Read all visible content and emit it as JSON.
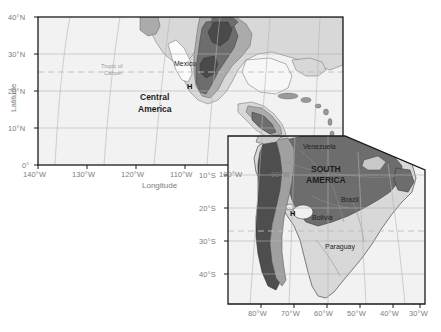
{
  "figure": {
    "background_color": "#ffffff",
    "type": "two-panel-locator-map"
  },
  "panels": [
    {
      "id": "north-panel",
      "name": "Central America panel",
      "frame": {
        "x": 38,
        "y": 17,
        "width": 305,
        "height": 148
      },
      "axes": {
        "x_title": "Longitude",
        "y_title": "Latitude",
        "x_ticks": [
          "140°W",
          "130°W",
          "120°W",
          "110°W",
          "100°W",
          "90°W"
        ],
        "x_values": [
          -140,
          -130,
          -120,
          -110,
          -100,
          -90
        ],
        "y_ticks": [
          "40°N",
          "30°N",
          "20°N",
          "10°N",
          "0°"
        ],
        "y_values": [
          40,
          30,
          20,
          10,
          0
        ],
        "xlim": [
          -145,
          -83
        ],
        "ylim": [
          0,
          40
        ]
      },
      "annotations": [
        {
          "text": "Tropic of Cancer",
          "kind": "graticule-label",
          "lat": 23.5
        },
        {
          "text": "Mexico",
          "kind": "country"
        },
        {
          "text": "Central America",
          "kind": "region"
        },
        {
          "text": "H",
          "kind": "point-marker"
        }
      ]
    },
    {
      "id": "south-panel",
      "name": "South America panel",
      "frame": {
        "x": 228,
        "y": 136,
        "width": 197,
        "height": 168
      },
      "axes": {
        "x_ticks": [
          "80°W",
          "70°W",
          "60°W",
          "50°W",
          "40°W",
          "30°W"
        ],
        "x_values": [
          -80,
          -70,
          -60,
          -50,
          -40,
          -30
        ],
        "y_ticks": [
          "10°S",
          "20°S",
          "30°S",
          "40°S"
        ],
        "y_values": [
          -10,
          -20,
          -30,
          -40
        ],
        "xlim": [
          -85,
          -27
        ],
        "ylim": [
          -42,
          12
        ]
      },
      "annotations": [
        {
          "text": "Venezuela",
          "kind": "country"
        },
        {
          "text": "SOUTH AMERICA",
          "kind": "region"
        },
        {
          "text": "Brazil",
          "kind": "country"
        },
        {
          "text": "Bolivia",
          "kind": "country"
        },
        {
          "text": "Paraguay",
          "kind": "country"
        },
        {
          "text": "H",
          "kind": "point-marker"
        },
        {
          "text": "Tropic of Capricorn",
          "kind": "graticule-line",
          "lat": -23.5,
          "labelled": false
        }
      ]
    }
  ],
  "labels": {
    "latitude_title": "Latitude",
    "longitude_title": "Longitude",
    "tropic_of_cancer_line1": "Tropic of",
    "tropic_of_cancer_line2": "Cancer",
    "mexico": "Mexico",
    "central_america_line1": "Central",
    "central_america_line2": "America",
    "h_marker_north": "H",
    "venezuela": "Venezuela",
    "south_america_line1": "SOUTH",
    "south_america_line2": "AMERICA",
    "brazil": "Brazil",
    "bolivia": "Bolivia",
    "paraguay": "Paraguay",
    "h_marker_south": "H",
    "lat_40n": "40°N",
    "lat_30n": "30°N",
    "lat_20n": "20°N",
    "lat_10n": "10°N",
    "lat_0": "0°",
    "lon_140w": "140°W",
    "lon_130w": "130°W",
    "lon_120w": "120°W",
    "lon_110w": "110°W",
    "lon_100w": "100°W",
    "lon_90w": "90°W",
    "lat_10s": "10°S",
    "lat_20s": "20°S",
    "lat_30s": "30°S",
    "lat_40s": "40°S",
    "lon_80w": "80°W",
    "lon_70w": "70°W",
    "lon_60w": "60°W",
    "lon_50w": "50°W",
    "lon_40w": "40°W",
    "lon_30w": "30°W"
  },
  "colors": {
    "frame": "#1a1a1a",
    "ocean": "#f2f2f2",
    "land_light": "#d9d9d9",
    "land_mid": "#a8a8a8",
    "land_dark": "#6e6e6e",
    "land_darkest": "#4e4e4e",
    "graticule": "#b4b4b4",
    "tropic_dash": "#c2b9b0",
    "coastline": "#555555",
    "tick_text": "#7d7d7d",
    "place_text": "#1d1d1d"
  }
}
